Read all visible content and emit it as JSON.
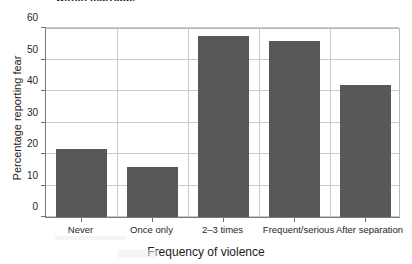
{
  "title": {
    "text": "within marriage",
    "note": "partially cropped at top edge of image"
  },
  "axis": {
    "y_title": "Percentage reporting fear",
    "x_title": "Frequency of violence",
    "y_ticks": [
      "0",
      "10",
      "20",
      "30",
      "40",
      "50",
      "60"
    ]
  },
  "colors": {
    "bar_fill": "#585858",
    "gridline": "#c9c9c9",
    "axis_line": "#7a7a7a",
    "text": "#231f20",
    "background": "#ffffff"
  },
  "chart_data": {
    "type": "bar",
    "title": "within marriage",
    "xlabel": "Frequency of violence",
    "ylabel": "Percentage reporting fear",
    "ylim": [
      0,
      60
    ],
    "ytick_step": 10,
    "grid": "horizontal-and-vertical",
    "legend": "none",
    "categories": [
      "Never",
      "Once only",
      "2–3 times",
      "Frequent/serious",
      "After separation"
    ],
    "values": [
      21.5,
      16,
      57.5,
      56,
      42
    ],
    "series": [
      {
        "name": "Percentage reporting fear",
        "values": [
          21.5,
          16,
          57.5,
          56,
          42
        ]
      }
    ]
  }
}
